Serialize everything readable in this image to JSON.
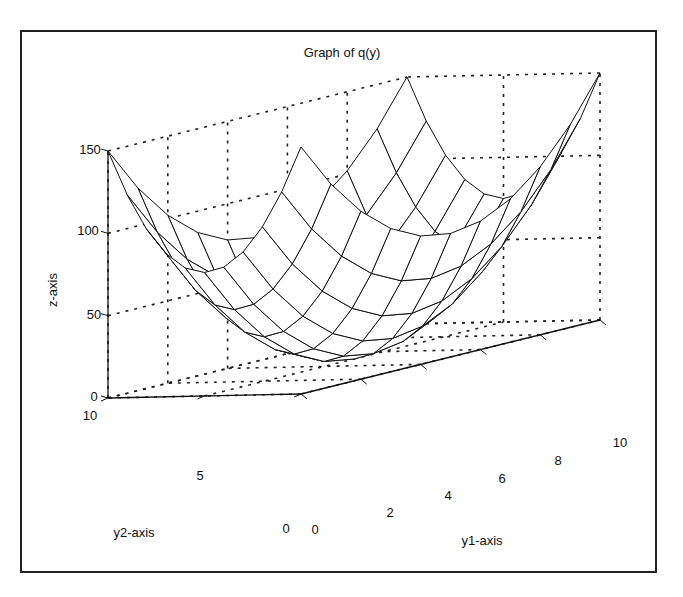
{
  "chart_data": {
    "type": "surface",
    "title": "Graph of q(y)",
    "xlabel": "y1-axis",
    "ylabel": "y2-axis",
    "zlabel": "z-axis",
    "x_ticks": [
      0,
      2,
      4,
      6,
      8,
      10
    ],
    "y_ticks": [
      0,
      5,
      10
    ],
    "z_ticks": [
      0,
      50,
      100,
      150
    ],
    "xlim": [
      0,
      10
    ],
    "ylim": [
      0,
      10
    ],
    "zlim": [
      0,
      150
    ],
    "grid": true,
    "grid_style": "dotted",
    "mesh_resolution": 11,
    "function": "z = (y1-5)^2 + (y2-5)^2 scaled to peak ~150 at corners",
    "center_min": [
      5,
      5,
      0
    ],
    "corner_max": 150,
    "colors": {
      "line": "#111111",
      "grid": "#222222",
      "frame": "#222222",
      "background": "#ffffff"
    }
  },
  "labels": {
    "title": "Graph of q(y)",
    "x_axis": "y1-axis",
    "y_axis": "y2-axis",
    "z_axis": "z-axis",
    "x_tick_0": "0",
    "x_tick_2": "2",
    "x_tick_4": "4",
    "x_tick_6": "6",
    "x_tick_8": "8",
    "x_tick_10": "10",
    "y_tick_0": "0",
    "y_tick_5": "5",
    "y_tick_10": "10",
    "z_tick_0": "0",
    "z_tick_50": "50",
    "z_tick_100": "100",
    "z_tick_150": "150"
  }
}
